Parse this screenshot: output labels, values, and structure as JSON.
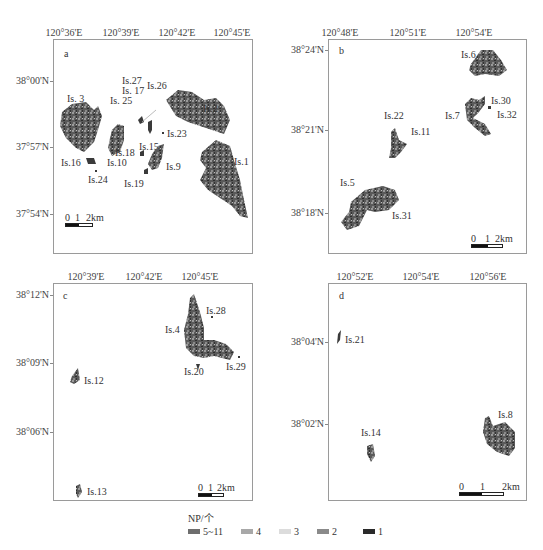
{
  "panels": [
    {
      "id": "a",
      "letter": "a",
      "x_ticks": [
        "120°36'E",
        "120°39'E",
        "120°42'E",
        "120°45'E"
      ],
      "y_ticks": [
        "38°00'N",
        "37°57'N",
        "37°54'N"
      ],
      "islands": [
        "Is.1",
        "Is.2",
        "Is. 3",
        "Is.9",
        "Is.10",
        "Is.15",
        "Is.16",
        "Is. 17",
        "Is.18",
        "Is.19",
        "Is.23",
        "Is.24",
        "Is. 25",
        "Is.26",
        "Is.27"
      ],
      "scale": {
        "n0": "0",
        "n1": "1",
        "n2": "2km"
      }
    },
    {
      "id": "b",
      "letter": "b",
      "x_ticks": [
        "120°48'E",
        "120°51'E",
        "120°54'E"
      ],
      "y_ticks": [
        "38°24'N",
        "38°21'N",
        "38°18'N"
      ],
      "islands": [
        "Is.5",
        "Is.6",
        "Is.7",
        "Is.11",
        "Is.22",
        "Is.30",
        "Is.31",
        "Is.32"
      ],
      "scale": {
        "n0": "0",
        "n1": "1",
        "n2": "2km"
      }
    },
    {
      "id": "c",
      "letter": "c",
      "x_ticks": [
        "120°39'E",
        "120°42'E",
        "120°45'E"
      ],
      "y_ticks": [
        "38°12'N",
        "38°09'N",
        "38°06'N"
      ],
      "islands": [
        "Is.4",
        "Is.12",
        "Is.13",
        "Is.20",
        "Is.28",
        "Is.29"
      ],
      "scale": {
        "n0": "0",
        "n1": "1",
        "n2": "2km"
      }
    },
    {
      "id": "d",
      "letter": "d",
      "x_ticks": [
        "120°52'E",
        "120°54'E",
        "120°56'E"
      ],
      "y_ticks": [
        "38°04'N",
        "38°02'N"
      ],
      "islands": [
        "Is.8",
        "Is.14",
        "Is.21"
      ],
      "scale": {
        "n0": "0",
        "n1": "1",
        "n2": "2km"
      }
    }
  ],
  "legend": {
    "title": "NP/个",
    "items": [
      {
        "label": "5~11",
        "color": "#6e6e6e"
      },
      {
        "label": "4",
        "color": "#a8a8a8"
      },
      {
        "label": "3",
        "color": "#dcdcdc"
      },
      {
        "label": "2",
        "color": "#8a8a8a"
      },
      {
        "label": "1",
        "color": "#2a2a2a"
      }
    ]
  },
  "colors": {
    "island_dark": "#3a3a3a",
    "island_mid": "#6a6a6a",
    "island_light": "#9a9a9a",
    "frame": "#9a9a9a"
  }
}
